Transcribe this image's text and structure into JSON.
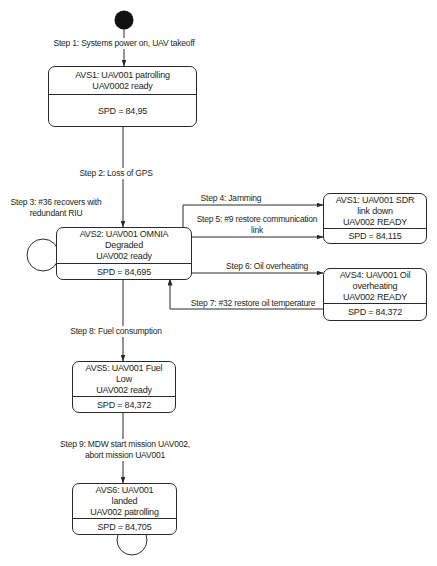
{
  "colors": {
    "background": "#ffffff",
    "line": "#2a2a2a",
    "text": "#231f20",
    "initial_node": "#111111"
  },
  "diagram": {
    "initial_node": "filled-circle",
    "states": [
      {
        "lines": [
          "AVS1: UAV001 patrolling",
          "UAV0002 ready"
        ],
        "spd": "SPD = 84,95"
      },
      {
        "lines": [
          "AVS2: UAV001 OMNIA",
          "Degraded",
          "UAV002 ready"
        ],
        "spd": "SPD = 84,695"
      },
      {
        "lines": [
          "AVS1: UAV001 SDR",
          "link down",
          "UAV002 READY"
        ],
        "spd": "SPD = 84,115"
      },
      {
        "lines": [
          "AVS4: UAV001 Oil",
          "overheating",
          "UAV002 READY"
        ],
        "spd": "SPD = 84,372"
      },
      {
        "lines": [
          "AVS5: UAV001 Fuel",
          "Low",
          "UAV002 ready"
        ],
        "spd": "SPD = 84,372"
      },
      {
        "lines": [
          "AVS6: UAV001",
          "landed",
          "UAV002 patrolling"
        ],
        "spd": "SPD = 84,705"
      }
    ],
    "transitions": [
      {
        "lines": [
          "Step 1: Systems power on, UAV takeoff"
        ]
      },
      {
        "lines": [
          "Step 2: Loss of GPS"
        ]
      },
      {
        "lines": [
          "Step 3: #36 recovers with",
          "redundant RIU"
        ]
      },
      {
        "lines": [
          "Step 4: Jamming"
        ]
      },
      {
        "lines": [
          "Step 5: #9 restore communication",
          "link"
        ]
      },
      {
        "lines": [
          "Step 6: Oil overheating"
        ]
      },
      {
        "lines": [
          "Step 7: #32 restore oil temperature"
        ]
      },
      {
        "lines": [
          "Step 8: Fuel consumption"
        ]
      },
      {
        "lines": [
          "Step 9: MDW start mission UAV002,",
          "abort mission UAV001"
        ]
      }
    ]
  }
}
